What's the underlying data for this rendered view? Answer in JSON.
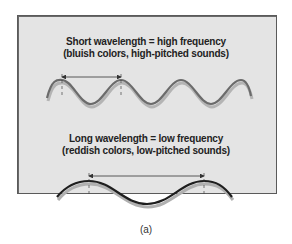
{
  "short_wave": {
    "line1": "Short wavelength = high frequency",
    "line2": "(bluish colors, high-pitched sounds)"
  },
  "long_wave": {
    "line1": "Long wavelength = low frequency",
    "line2": "(reddish colors, low-pitched sounds)"
  },
  "caption": "(a)",
  "colors": {
    "panel_bg": "#e4e4e4",
    "border": "#5a5a5a",
    "short_wave_line": "#6b6b6b",
    "long_wave_line": "#1e1e1e",
    "shadow": "#b0b0b0"
  }
}
